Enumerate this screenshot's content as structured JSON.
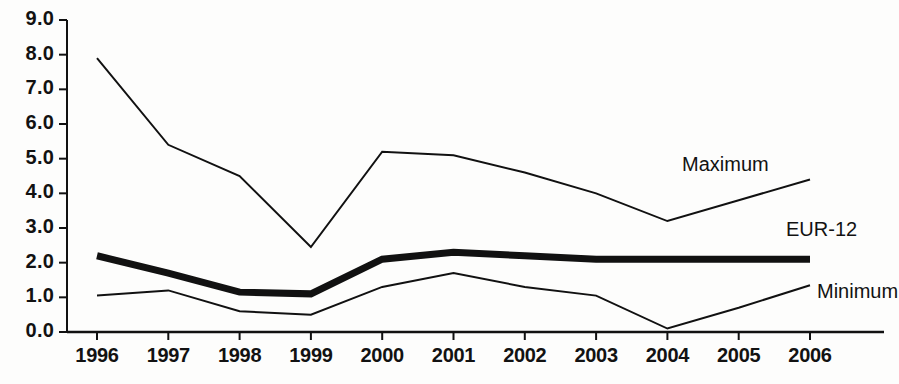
{
  "chart_data": {
    "type": "line",
    "title": "",
    "subtitle": "",
    "xlabel": "",
    "ylabel": "",
    "categories": [
      "1996",
      "1997",
      "1998",
      "1999",
      "2000",
      "2001",
      "2002",
      "2003",
      "2004",
      "2005",
      "2006"
    ],
    "x": [
      1996,
      1997,
      1998,
      1999,
      2000,
      2001,
      2002,
      2003,
      2004,
      2005,
      2006
    ],
    "ylim": [
      0.0,
      9.0
    ],
    "ytick_step": 1.0,
    "ytick_labels": [
      "0.0",
      "1.0",
      "2.0",
      "3.0",
      "4.0",
      "5.0",
      "6.0",
      "7.0",
      "8.0",
      "9.0"
    ],
    "ytick_values": [
      0.0,
      1.0,
      2.0,
      3.0,
      4.0,
      5.0,
      6.0,
      7.0,
      8.0,
      9.0
    ],
    "grid": false,
    "legend_position": "inline-right",
    "series": [
      {
        "name": "Maximum",
        "color": "#111111",
        "line_width": 2,
        "values": [
          7.9,
          5.4,
          4.5,
          2.45,
          5.2,
          5.1,
          4.6,
          4.0,
          3.2,
          3.8,
          4.4
        ]
      },
      {
        "name": "EUR-12",
        "color": "#111111",
        "line_width": 7,
        "values": [
          2.2,
          1.7,
          1.15,
          1.1,
          2.1,
          2.3,
          2.2,
          2.1,
          2.1,
          2.1,
          2.1
        ]
      },
      {
        "name": "Minimum",
        "color": "#111111",
        "line_width": 2,
        "values": [
          1.05,
          1.2,
          0.6,
          0.5,
          1.3,
          1.7,
          1.3,
          1.05,
          0.1,
          0.7,
          1.35
        ]
      }
    ],
    "annotations": [
      {
        "text": "Maximum",
        "series": "Maximum"
      },
      {
        "text": "EUR-12",
        "series": "EUR-12"
      },
      {
        "text": "Minimum",
        "series": "Minimum"
      }
    ]
  },
  "axis": {
    "axis_color": "#111111",
    "background": "#fdfdfc"
  }
}
